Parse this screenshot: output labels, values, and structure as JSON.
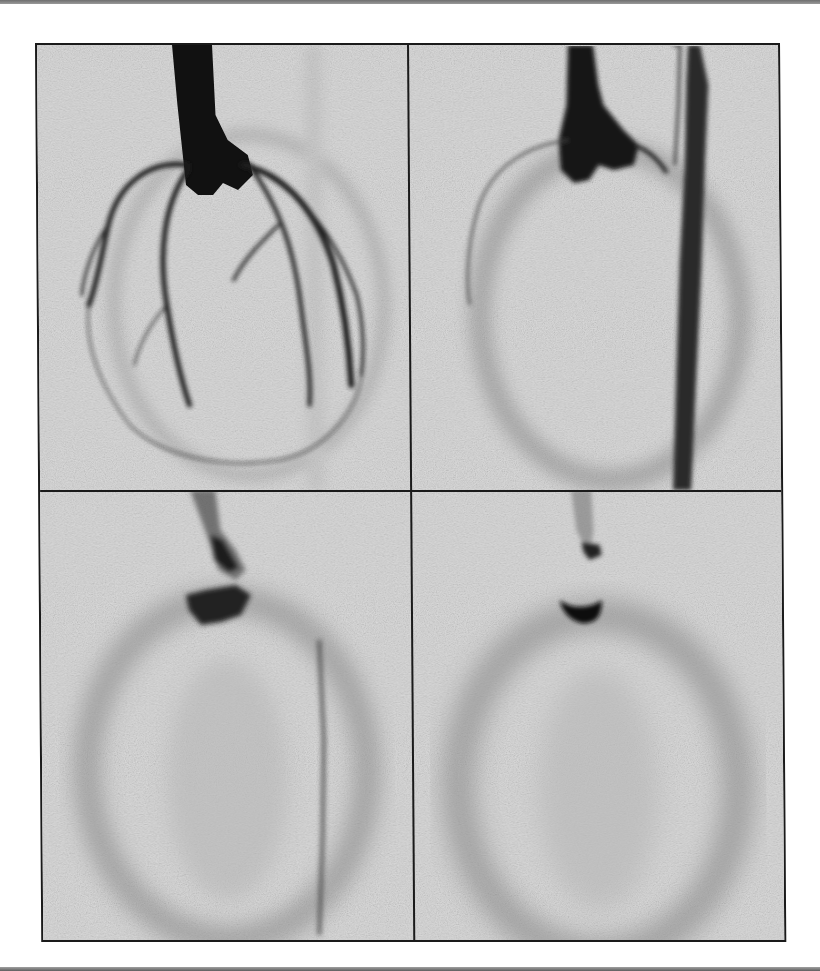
{
  "figure": {
    "layout": "2x2 grid",
    "background_color": "#ffffff",
    "frame_color": "#1a1a1a",
    "panels": [
      {
        "position": "top-left",
        "content": "coronary angiogram with dense catheter/aortic root and branching coronary arteries outlining the heart"
      },
      {
        "position": "top-right",
        "content": "angiogram with contrast-filled aortic root and a long dark vertical vessel on the right; faint ventricular outline"
      },
      {
        "position": "bottom-left",
        "content": "late-phase image: faint contrast near aortic root and diffuse ellipsoid myocardial blush with a thin vertical vessel"
      },
      {
        "position": "bottom-right",
        "content": "late-phase image: small dense contrast near root and diffuse ellipsoid myocardial blush"
      }
    ]
  }
}
